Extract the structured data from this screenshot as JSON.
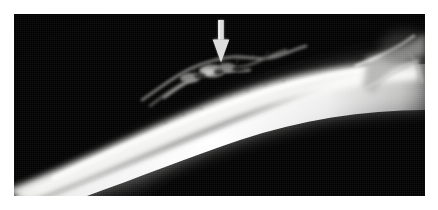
{
  "figure": {
    "kind": "radiograph",
    "modality": "X-ray",
    "view": "lateral",
    "background_color": "#ffffff",
    "plate_color": "#000000",
    "plate": {
      "x": 14,
      "y": 14,
      "width": 411,
      "height": 182
    },
    "caption": "",
    "title": ""
  },
  "annotations": {
    "arrow": {
      "name": "pointer-arrow",
      "direction": "down",
      "color": "#dcdcdc",
      "shaft": {
        "x": 217,
        "y": 20,
        "width": 6,
        "height": 19
      },
      "head": {
        "x": 212,
        "y": 39,
        "width": 15,
        "height": 23
      },
      "tip": {
        "x": 219,
        "y": 62
      },
      "points_to": "periosteal-reaction"
    },
    "labels": []
  },
  "anatomy": {
    "structures": [
      {
        "name": "long-bone-diaphysis",
        "description": "bright obliquely oriented cortical shaft",
        "brightness": "#f2f2f0",
        "enters_at": "lower-left",
        "exits_at": "right"
      },
      {
        "name": "periosteal-reaction",
        "description": "irregular wispy lucent/opaque reaction along the superior cortex",
        "brightness": "#8a8a8a",
        "region": {
          "x": 150,
          "y": 52,
          "width": 130,
          "height": 35
        }
      },
      {
        "name": "metaphysis-joint",
        "description": "flared bright bone margin at right edge of film",
        "brightness": "#d4d4d2",
        "region": {
          "x": 370,
          "y": 30,
          "width": 55,
          "height": 70
        }
      },
      {
        "name": "soft-tissue-shadow",
        "description": "faint grey haze superior to the cortex",
        "brightness": "#2a2a2a"
      }
    ]
  },
  "palette": {
    "paper": "#ffffff",
    "film_black": "#000000",
    "bone_bright": "#f5f5f3",
    "bone_mid": "#b8b8b5",
    "bone_dim": "#606060",
    "arrow": "#dcdcdc",
    "haze": "#3a3a3a"
  }
}
